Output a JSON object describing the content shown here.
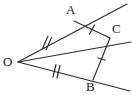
{
  "figure": {
    "kind": "geometry-diagram",
    "canvas": {
      "width": 132,
      "height": 98
    },
    "stroke_color": "#2b2b2b",
    "label_color": "#1a1a1a",
    "background_color": "#ffffff",
    "points": [
      {
        "id": "O",
        "label": "O",
        "x": 18,
        "y": 62,
        "label_x": 3,
        "label_y": 55
      },
      {
        "id": "A",
        "label": "A",
        "x": 74,
        "y": 21,
        "label_x": 66,
        "label_y": 3
      },
      {
        "id": "B",
        "label": "B",
        "x": 93,
        "y": 80,
        "label_x": 86,
        "label_y": 80
      },
      {
        "id": "C",
        "label": "C",
        "x": 110,
        "y": 38,
        "label_x": 112,
        "label_y": 22
      }
    ],
    "segments": [
      {
        "id": "OA",
        "from": "O",
        "to": "A",
        "ticks": 2,
        "tick_style": "double-slash"
      },
      {
        "id": "OB",
        "from": "O",
        "to": "B",
        "ticks": 2,
        "tick_style": "double-slash"
      },
      {
        "id": "OC",
        "from": "O",
        "to": "C",
        "ticks": 0,
        "tick_style": "none"
      },
      {
        "id": "CA",
        "from": "C",
        "to": "A",
        "ticks": 1,
        "tick_style": "single-slash"
      },
      {
        "id": "CB",
        "from": "C",
        "to": "B",
        "ticks": 1,
        "tick_style": "single-slash"
      }
    ],
    "rays": [
      {
        "id": "ray-OA-extension",
        "through": "A",
        "from": "O",
        "to_x": 127,
        "to_y": 4
      },
      {
        "id": "ray-OB-extension",
        "through": "B",
        "from": "O",
        "to_x": 130,
        "to_y": 91
      },
      {
        "id": "ray-OC-extension",
        "through": "C",
        "from": "O",
        "to_x": 131,
        "to_y": 42
      }
    ],
    "tick_marks": [
      {
        "id": "tick-OA",
        "segment": "OA",
        "x": 46,
        "y": 41.5,
        "count": 2
      },
      {
        "id": "tick-OB",
        "segment": "OB",
        "x": 55.5,
        "y": 71,
        "count": 2
      },
      {
        "id": "tick-CA",
        "segment": "CA",
        "x": 92,
        "y": 29.5,
        "count": 1
      },
      {
        "id": "tick-CB",
        "segment": "CB",
        "x": 101.5,
        "y": 59,
        "count": 1
      }
    ]
  }
}
